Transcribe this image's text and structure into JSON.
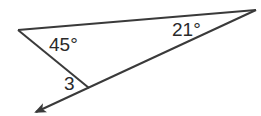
{
  "diagram": {
    "type": "geometry-triangle",
    "line_color": "#3a3a3a",
    "vertices": {
      "left": {
        "x": 18,
        "y": 30
      },
      "right": {
        "x": 256,
        "y": 10
      },
      "bottom": {
        "x": 89,
        "y": 88
      }
    },
    "extension_arrow": {
      "from": {
        "x": 89,
        "y": 88
      },
      "to": {
        "x": 34,
        "y": 113
      }
    },
    "labels": {
      "angle_left": "45°",
      "angle_right": "21°",
      "angle_3": "3"
    }
  }
}
